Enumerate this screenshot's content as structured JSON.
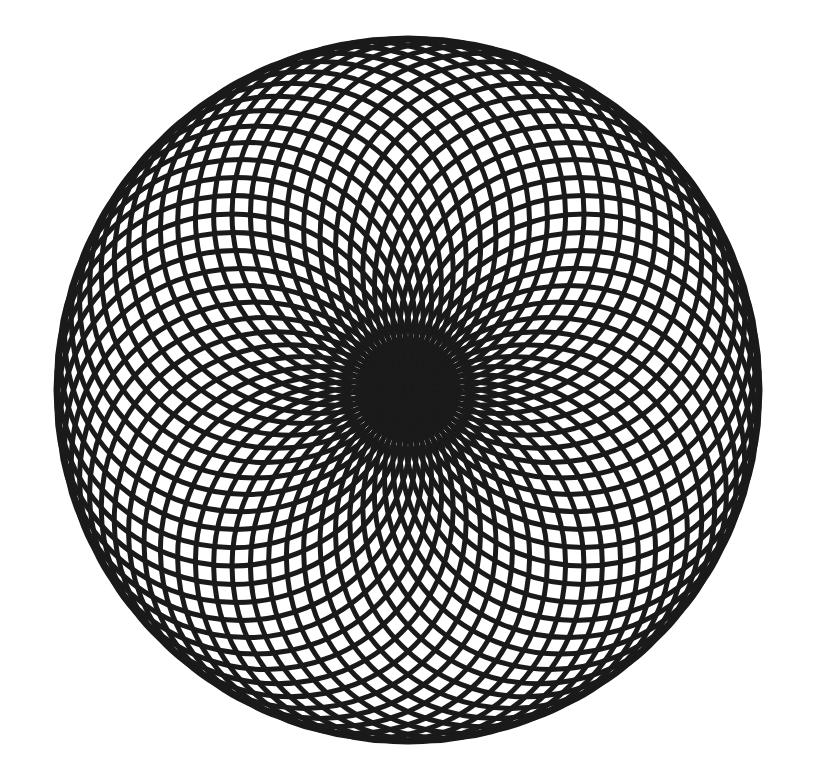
{
  "canvas": {
    "width": 823,
    "height": 781,
    "background_color": "#ffffff"
  },
  "artwork": {
    "name": "spirograph-rosette",
    "type": "geometric-line-art",
    "description": "Black-and-white spirograph rosette formed by two mirrored families of circular arcs all passing through a common centre, producing a woven diamond lattice with scalloped petal rim."
  },
  "figure": {
    "center_x": 408,
    "center_y": 390,
    "outer_radius": 352,
    "stroke_color": "#1a1a1a",
    "stroke_width": 5.0,
    "arcs_per_family": 30,
    "families": 2,
    "total_arcs": 60,
    "family_rotation_offset_deg": 6,
    "petal_tips": 30,
    "radial_spokes_at_center": 60,
    "lattice_cells_along_radius": 9,
    "arc_circle_radius_ratio": 0.5,
    "arc_sweep_deg": 360
  },
  "chart_data": {
    "type": "scatter",
    "subtitle": "",
    "xlabel": "",
    "ylabel": "",
    "xlim": [
      40,
      775
    ],
    "ylim": [
      38,
      745
    ],
    "grid": false,
    "legend_position": "none",
    "annotations": [],
    "series": [
      {
        "name": "clockwise-arc-family",
        "count": 30,
        "stroke": "#1a1a1a",
        "direction": "cw",
        "phase_deg": 0
      },
      {
        "name": "counter-clockwise-arc-family",
        "count": 30,
        "stroke": "#1a1a1a",
        "direction": "ccw",
        "phase_deg": 6
      }
    ]
  },
  "render": {
    "arc_family_a_name": "arc-family-clockwise",
    "arc_family_b_name": "arc-family-counter-clockwise"
  }
}
